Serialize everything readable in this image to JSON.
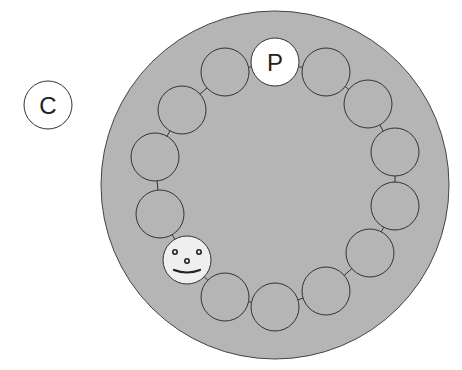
{
  "outside_node": {
    "label": "C",
    "cx": 48,
    "cy": 105,
    "r": 24
  },
  "table": {
    "cx": 275,
    "cy": 185,
    "r": 174,
    "fill": "#b5b5b5"
  },
  "seat_radius": 24,
  "seats": [
    {
      "cx": 275,
      "cy": 62,
      "type": "labeled",
      "label": "P",
      "fill": "#ffffff"
    },
    {
      "cx": 326,
      "cy": 72,
      "type": "empty"
    },
    {
      "cx": 368,
      "cy": 104,
      "type": "empty"
    },
    {
      "cx": 395,
      "cy": 152,
      "type": "empty"
    },
    {
      "cx": 395,
      "cy": 206,
      "type": "empty"
    },
    {
      "cx": 370,
      "cy": 253,
      "type": "empty"
    },
    {
      "cx": 326,
      "cy": 291,
      "type": "empty"
    },
    {
      "cx": 275,
      "cy": 307,
      "type": "empty"
    },
    {
      "cx": 225,
      "cy": 297,
      "type": "empty"
    },
    {
      "cx": 187,
      "cy": 260,
      "type": "face",
      "fill": "#efefef"
    },
    {
      "cx": 160,
      "cy": 214,
      "type": "empty"
    },
    {
      "cx": 155,
      "cy": 157,
      "type": "empty"
    },
    {
      "cx": 182,
      "cy": 110,
      "type": "empty"
    },
    {
      "cx": 225,
      "cy": 72,
      "type": "empty"
    }
  ],
  "colors": {
    "stroke": "#333333",
    "seat_fill": "#b5b5b5",
    "outside_fill": "#ffffff"
  }
}
